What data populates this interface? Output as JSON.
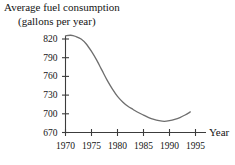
{
  "chart_data": {
    "type": "line",
    "title": "Average fuel consumption",
    "subtitle": "(gallons per year)",
    "xlabel": "Year",
    "ylabel": "",
    "grid": false,
    "legend": "none",
    "line_color": "#6e6e6e",
    "axis_color": "#3c3c3c",
    "xlim": [
      1970,
      1997
    ],
    "ylim": [
      670,
      832
    ],
    "xticks": [
      1970,
      1975,
      1980,
      1985,
      1990,
      1995
    ],
    "xtick_labels": [
      "1970",
      "1975",
      "1980",
      "1985",
      "1990",
      "1995"
    ],
    "yticks": [
      670,
      700,
      730,
      760,
      790,
      820
    ],
    "ytick_labels": [
      "670",
      "700",
      "730",
      "760",
      "790",
      "820"
    ],
    "x": [
      1970,
      1971,
      1972,
      1973,
      1974,
      1975,
      1976,
      1977,
      1978,
      1979,
      1980,
      1981,
      1982,
      1983,
      1984,
      1985,
      1986,
      1987,
      1988,
      1989,
      1990,
      1991,
      1992,
      1993,
      1994
    ],
    "values": [
      825,
      826,
      824,
      820,
      812,
      800,
      786,
      770,
      754,
      740,
      728,
      719,
      712,
      707,
      702,
      698,
      694,
      691,
      689,
      688,
      689,
      691,
      694,
      698,
      703
    ]
  }
}
